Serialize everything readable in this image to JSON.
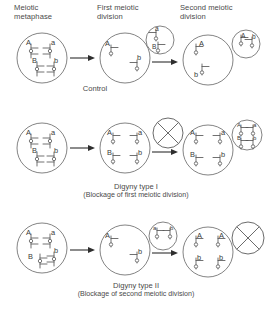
{
  "figure": {
    "type": "biology-process-diagram",
    "alleles": [
      "A",
      "a",
      "B",
      "b"
    ],
    "stage_headers": [
      {
        "id": "meiotic-metaphase",
        "line1": "Meiotic",
        "line2": "metaphase"
      },
      {
        "id": "first-meiotic-division",
        "line1": "First meiotic",
        "line2": "division"
      },
      {
        "id": "second-meiotic-division",
        "line1": "Second meiotic",
        "line2": "division"
      }
    ],
    "rows": [
      {
        "id": "control",
        "caption": "Control",
        "subcaption": "",
        "cells": [
          {
            "id": "control-metaphase",
            "kind": "oocyte",
            "chromosomes": [
              "A",
              "a",
              "B",
              "b"
            ]
          },
          {
            "id": "control-after-mi",
            "kind": "oocyte",
            "chromosomes": [
              "A",
              "b"
            ]
          },
          {
            "id": "control-polar-body-1",
            "kind": "polar-body",
            "chromosomes": [
              "a",
              "B"
            ]
          },
          {
            "id": "control-ootid",
            "kind": "oocyte",
            "chromosomes": [
              "A",
              "b"
            ]
          },
          {
            "id": "control-polar-body-2",
            "kind": "polar-body",
            "chromosomes": [
              "A",
              "b"
            ]
          }
        ],
        "blocked": false
      },
      {
        "id": "digyny-type-1",
        "caption": "Digyny type I",
        "subcaption": "(Blockage of first meiotic division)",
        "cells": [
          {
            "id": "digyny1-metaphase",
            "kind": "oocyte",
            "chromosomes": [
              "A",
              "a",
              "B",
              "b"
            ]
          },
          {
            "id": "digyny1-after-mi",
            "kind": "oocyte",
            "chromosomes": [
              "A",
              "a",
              "B",
              "b"
            ]
          },
          {
            "id": "digyny1-blocked-polar-body",
            "kind": "blocked",
            "chromosomes": []
          },
          {
            "id": "digyny1-ootid",
            "kind": "oocyte",
            "chromosomes": [
              "A",
              "a",
              "B",
              "b"
            ]
          },
          {
            "id": "digyny1-polar-body",
            "kind": "polar-body",
            "chromosomes": [
              "A",
              "a",
              "B",
              "b"
            ]
          }
        ],
        "blocked": true,
        "blocked_stage": "first-meiotic-division"
      },
      {
        "id": "digyny-type-2",
        "caption": "Digyny type II",
        "subcaption": "(Blockage of second meiotic division)",
        "cells": [
          {
            "id": "digyny2-metaphase",
            "kind": "oocyte",
            "chromosomes": [
              "A",
              "a",
              "B",
              "b"
            ]
          },
          {
            "id": "digyny2-after-mi",
            "kind": "oocyte",
            "chromosomes": [
              "A",
              "b"
            ]
          },
          {
            "id": "digyny2-polar-body-1",
            "kind": "polar-body",
            "chromosomes": [
              "a",
              "b"
            ]
          },
          {
            "id": "digyny2-ootid",
            "kind": "oocyte",
            "chromosomes": [
              "A",
              "A",
              "b",
              "b"
            ]
          },
          {
            "id": "digyny2-blocked-polar-body",
            "kind": "blocked",
            "chromosomes": []
          }
        ],
        "blocked": true,
        "blocked_stage": "second-meiotic-division"
      }
    ],
    "colors": {
      "background": "#ffffff",
      "text": "#4a4a4a",
      "cell_stroke": "#6d6d6d",
      "chromosome_stroke": "#575757",
      "arrow": "#2e2e2e"
    }
  }
}
